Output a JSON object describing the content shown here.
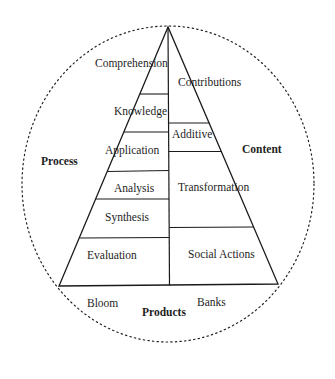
{
  "diagram": {
    "type": "pyramid-in-circle",
    "left_side_title": "Process",
    "right_side_title": "Content",
    "bottom_title": "Products",
    "left_footer": "Bloom",
    "right_footer": "Banks",
    "left_levels": [
      {
        "label": "Comprehension"
      },
      {
        "label": "Knowledge"
      },
      {
        "label": "Application"
      },
      {
        "label": "Analysis"
      },
      {
        "label": "Synthesis"
      },
      {
        "label": "Evaluation"
      }
    ],
    "right_levels": [
      {
        "label": "Contributions"
      },
      {
        "label": "Additive"
      },
      {
        "label": "Transformation"
      },
      {
        "label": "Social Actions"
      }
    ],
    "colors": {
      "line": "#1a1a1a",
      "background": "#ffffff"
    }
  }
}
